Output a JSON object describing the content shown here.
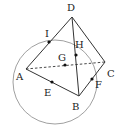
{
  "diagram": {
    "type": "geometry-tetrahedron-with-circle",
    "colors": {
      "stroke": "#333333",
      "circle": "#888888",
      "dot": "#111111",
      "background": "#ffffff"
    },
    "points": {
      "D": {
        "label": "D",
        "x": 72,
        "y": 17,
        "lx": 67,
        "ly": 11
      },
      "A": {
        "label": "A",
        "x": 26,
        "y": 69,
        "lx": 16,
        "ly": 80
      },
      "B": {
        "label": "B",
        "x": 79,
        "y": 96,
        "lx": 72,
        "ly": 110
      },
      "C": {
        "label": "C",
        "x": 105,
        "y": 62,
        "lx": 107,
        "ly": 77
      },
      "I": {
        "label": "I",
        "x": 49,
        "y": 42,
        "lx": 45,
        "ly": 37
      },
      "H": {
        "label": "H",
        "x": 76,
        "y": 55,
        "lx": 75,
        "ly": 48
      },
      "G": {
        "label": "G",
        "x": 65,
        "y": 65,
        "lx": 58,
        "ly": 61
      },
      "E": {
        "label": "E",
        "x": 52,
        "y": 82,
        "lx": 44,
        "ly": 96
      },
      "F": {
        "label": "F",
        "x": 92,
        "y": 79,
        "lx": 95,
        "ly": 88
      }
    },
    "solid_edges": [
      [
        "D",
        "A"
      ],
      [
        "D",
        "B"
      ],
      [
        "D",
        "C"
      ],
      [
        "A",
        "B"
      ],
      [
        "B",
        "C"
      ]
    ],
    "dashed_edges": [
      [
        "A",
        "C"
      ]
    ],
    "circle": {
      "cx": 55,
      "cy": 82,
      "r": 42
    }
  }
}
